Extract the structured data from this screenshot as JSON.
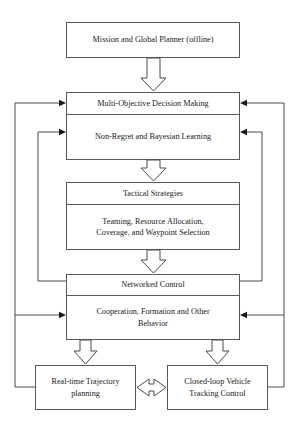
{
  "diagram": {
    "style": {
      "background": "#ffffff",
      "box_border": "#5a5a5a",
      "line": "#4a4a4a",
      "text": "#1a1a1a",
      "arrow_fill": "#ffffff"
    },
    "boxes": {
      "mission_planner": "Mission and Global Planner (offline)",
      "decision_making": "Multi-Objective Decision Making",
      "learning": "Non-Regret and Bayesian Learning",
      "tactical_strategies": "Tactical Strategies",
      "tactical_detail": "Teaming, Resource Allocation,\nCoverage, and Waypoint Selection",
      "networked_control": "Networked Control",
      "cooperation": "Cooperation, Formation and Other\nBehavior",
      "trajectory_planning": "Real-time Trajectory\nplanning",
      "tracking_control": "Closed-loop Vehicle\nTracking Control"
    },
    "connections": [
      {
        "name": "mission-to-decision",
        "type": "block-arrow-down",
        "from": "mission_planner",
        "to": "decision_making"
      },
      {
        "name": "learning-to-tactical",
        "type": "block-arrow-down",
        "from": "learning",
        "to": "tactical_strategies"
      },
      {
        "name": "tactical-to-networked",
        "type": "block-arrow-down",
        "from": "tactical_detail",
        "to": "networked_control"
      },
      {
        "name": "cooperation-to-trajectory",
        "type": "block-arrow-down",
        "from": "cooperation",
        "to": "trajectory_planning"
      },
      {
        "name": "cooperation-to-tracking",
        "type": "block-arrow-down",
        "from": "cooperation",
        "to": "tracking_control"
      },
      {
        "name": "trajectory-tracking-bidirectional",
        "type": "block-arrow-double",
        "from": "trajectory_planning",
        "to": "tracking_control"
      },
      {
        "name": "feedback-left-outer",
        "type": "feedback-line",
        "from": "trajectory_planning",
        "to": "decision_making"
      },
      {
        "name": "feedback-left-inner",
        "type": "feedback-line",
        "from": "networked_control",
        "to": "learning"
      },
      {
        "name": "feedback-left-cooperation",
        "type": "feedback-line",
        "from": "trajectory_planning",
        "to": "cooperation"
      },
      {
        "name": "feedback-right-outer",
        "type": "feedback-line",
        "from": "tracking_control",
        "to": "decision_making"
      },
      {
        "name": "feedback-right-inner",
        "type": "feedback-line",
        "from": "networked_control",
        "to": "learning"
      },
      {
        "name": "feedback-right-cooperation",
        "type": "feedback-line",
        "from": "tracking_control",
        "to": "cooperation"
      }
    ]
  }
}
